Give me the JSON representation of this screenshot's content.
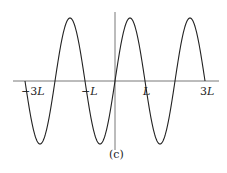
{
  "figure": {
    "caption": "(c)",
    "axis": {
      "x_ticks": [
        {
          "label_num": "−3",
          "label_var": "L",
          "value": -3
        },
        {
          "label_num": "−",
          "label_var": "L",
          "value": -1
        },
        {
          "label_num": "",
          "label_var": "L",
          "value": 1
        },
        {
          "label_num": "3",
          "label_var": "L",
          "value": 3
        }
      ]
    },
    "curve": {
      "function": "sin(pi*x/L)",
      "domain": [
        -3,
        3
      ],
      "color": "#222222"
    }
  }
}
